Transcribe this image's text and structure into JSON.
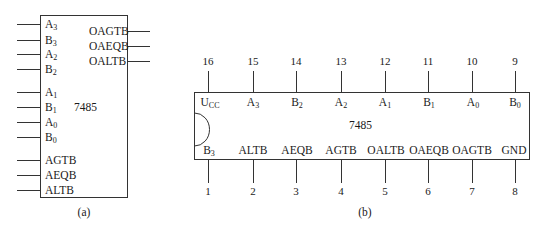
{
  "diagram_a": {
    "chip": "7485",
    "caption": "(a)",
    "inputs": [
      {
        "base": "A",
        "sub": "3"
      },
      {
        "base": "B",
        "sub": "3"
      },
      {
        "base": "A",
        "sub": "2"
      },
      {
        "base": "B",
        "sub": "2"
      },
      {
        "base": "A",
        "sub": "1"
      },
      {
        "base": "B",
        "sub": "1"
      },
      {
        "base": "A",
        "sub": "0"
      },
      {
        "base": "B",
        "sub": "0"
      },
      {
        "base": "AGTB",
        "sub": ""
      },
      {
        "base": "AEQB",
        "sub": ""
      },
      {
        "base": "ALTB",
        "sub": ""
      }
    ],
    "outputs": [
      "OAGTB",
      "OAEQB",
      "OALTB"
    ]
  },
  "diagram_b": {
    "chip": "7485",
    "caption": "(b)",
    "top_pins": [
      {
        "num": "16",
        "base": "U",
        "sub": "CC"
      },
      {
        "num": "15",
        "base": "A",
        "sub": "3"
      },
      {
        "num": "14",
        "base": "B",
        "sub": "2"
      },
      {
        "num": "13",
        "base": "A",
        "sub": "2"
      },
      {
        "num": "12",
        "base": "A",
        "sub": "1"
      },
      {
        "num": "11",
        "base": "B",
        "sub": "1"
      },
      {
        "num": "10",
        "base": "A",
        "sub": "0"
      },
      {
        "num": "9",
        "base": "B",
        "sub": "0"
      }
    ],
    "bottom_pins": [
      {
        "num": "1",
        "base": "B",
        "sub": "3"
      },
      {
        "num": "2",
        "base": "ALTB",
        "sub": ""
      },
      {
        "num": "3",
        "base": "AEQB",
        "sub": ""
      },
      {
        "num": "4",
        "base": "AGTB",
        "sub": ""
      },
      {
        "num": "5",
        "base": "OALTB",
        "sub": ""
      },
      {
        "num": "6",
        "base": "OAEQB",
        "sub": ""
      },
      {
        "num": "7",
        "base": "OAGTB",
        "sub": ""
      },
      {
        "num": "8",
        "base": "GND",
        "sub": ""
      }
    ]
  }
}
